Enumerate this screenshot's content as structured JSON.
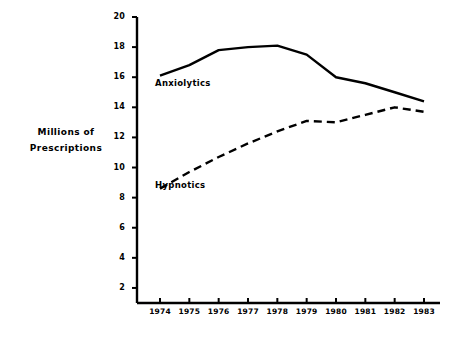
{
  "chart_data": {
    "type": "line",
    "title": "",
    "xlabel": "",
    "ylabel": "Millions of Prescriptions",
    "ylabel_lines": [
      "Millions of",
      "Prescriptions"
    ],
    "categories": [
      "1974",
      "1975",
      "1976",
      "1977",
      "1978",
      "1979",
      "1980",
      "1981",
      "1982",
      "1983"
    ],
    "x": [
      1974,
      1975,
      1976,
      1977,
      1978,
      1979,
      1980,
      1981,
      1982,
      1983
    ],
    "ylim": [
      0,
      20
    ],
    "yticks": [
      20,
      18,
      16,
      14,
      12,
      10,
      8,
      6,
      4,
      2
    ],
    "ytick_labels": [
      "20",
      "18",
      "16",
      "14",
      "12",
      "10",
      "8",
      "6",
      "4",
      "2"
    ],
    "grid": false,
    "legend_position": "inline-annotations",
    "series": [
      {
        "name": "Anxiolytics",
        "style": "solid",
        "color": "#000000",
        "values": [
          16.1,
          16.8,
          17.8,
          18.0,
          18.1,
          17.5,
          16.0,
          15.6,
          15.0,
          14.4
        ]
      },
      {
        "name": "Hypnotics",
        "style": "dashed",
        "color": "#000000",
        "values": [
          8.6,
          9.7,
          10.7,
          11.6,
          12.4,
          13.1,
          13.0,
          13.5,
          14.0,
          13.7
        ]
      }
    ],
    "annotations": [
      {
        "text": "Anxiolytics",
        "series": "Anxiolytics"
      },
      {
        "text": "Hypnotics",
        "series": "Hypnotics"
      }
    ]
  }
}
